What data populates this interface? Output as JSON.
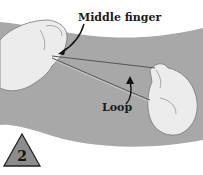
{
  "illustration": {
    "labels": {
      "middle_finger": "Middle finger",
      "loop": "Loop"
    },
    "step_number": "2",
    "colors": {
      "band": "#a8a8a8",
      "background": "#ffffff",
      "hand": "#ececec",
      "triangle": "#8c8c8c"
    }
  }
}
